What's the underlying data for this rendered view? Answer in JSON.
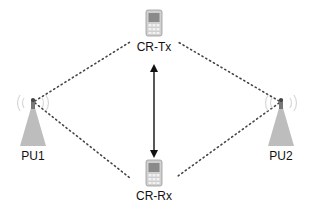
{
  "diagram": {
    "type": "network-topology",
    "nodes": [
      {
        "id": "cr-tx",
        "label": "CR-Tx",
        "kind": "mobile-phone",
        "x": 154,
        "y": 24
      },
      {
        "id": "cr-rx",
        "label": "CR-Rx",
        "kind": "mobile-phone",
        "x": 154,
        "y": 178
      },
      {
        "id": "pu1",
        "label": "PU1",
        "kind": "tower",
        "x": 33,
        "y": 118
      },
      {
        "id": "pu2",
        "label": "PU2",
        "kind": "tower",
        "x": 281,
        "y": 118
      }
    ],
    "edges": [
      {
        "from": "pu1",
        "to": "cr-tx",
        "style": "dotted"
      },
      {
        "from": "pu1",
        "to": "cr-rx",
        "style": "dotted"
      },
      {
        "from": "pu2",
        "to": "cr-tx",
        "style": "dotted"
      },
      {
        "from": "pu2",
        "to": "cr-rx",
        "style": "dotted"
      },
      {
        "from": "cr-tx",
        "to": "cr-rx",
        "style": "solid-double-arrow"
      }
    ],
    "colors": {
      "line": "#333333",
      "tower": "#bdbdbd",
      "phone": "#a0a0a0"
    }
  }
}
